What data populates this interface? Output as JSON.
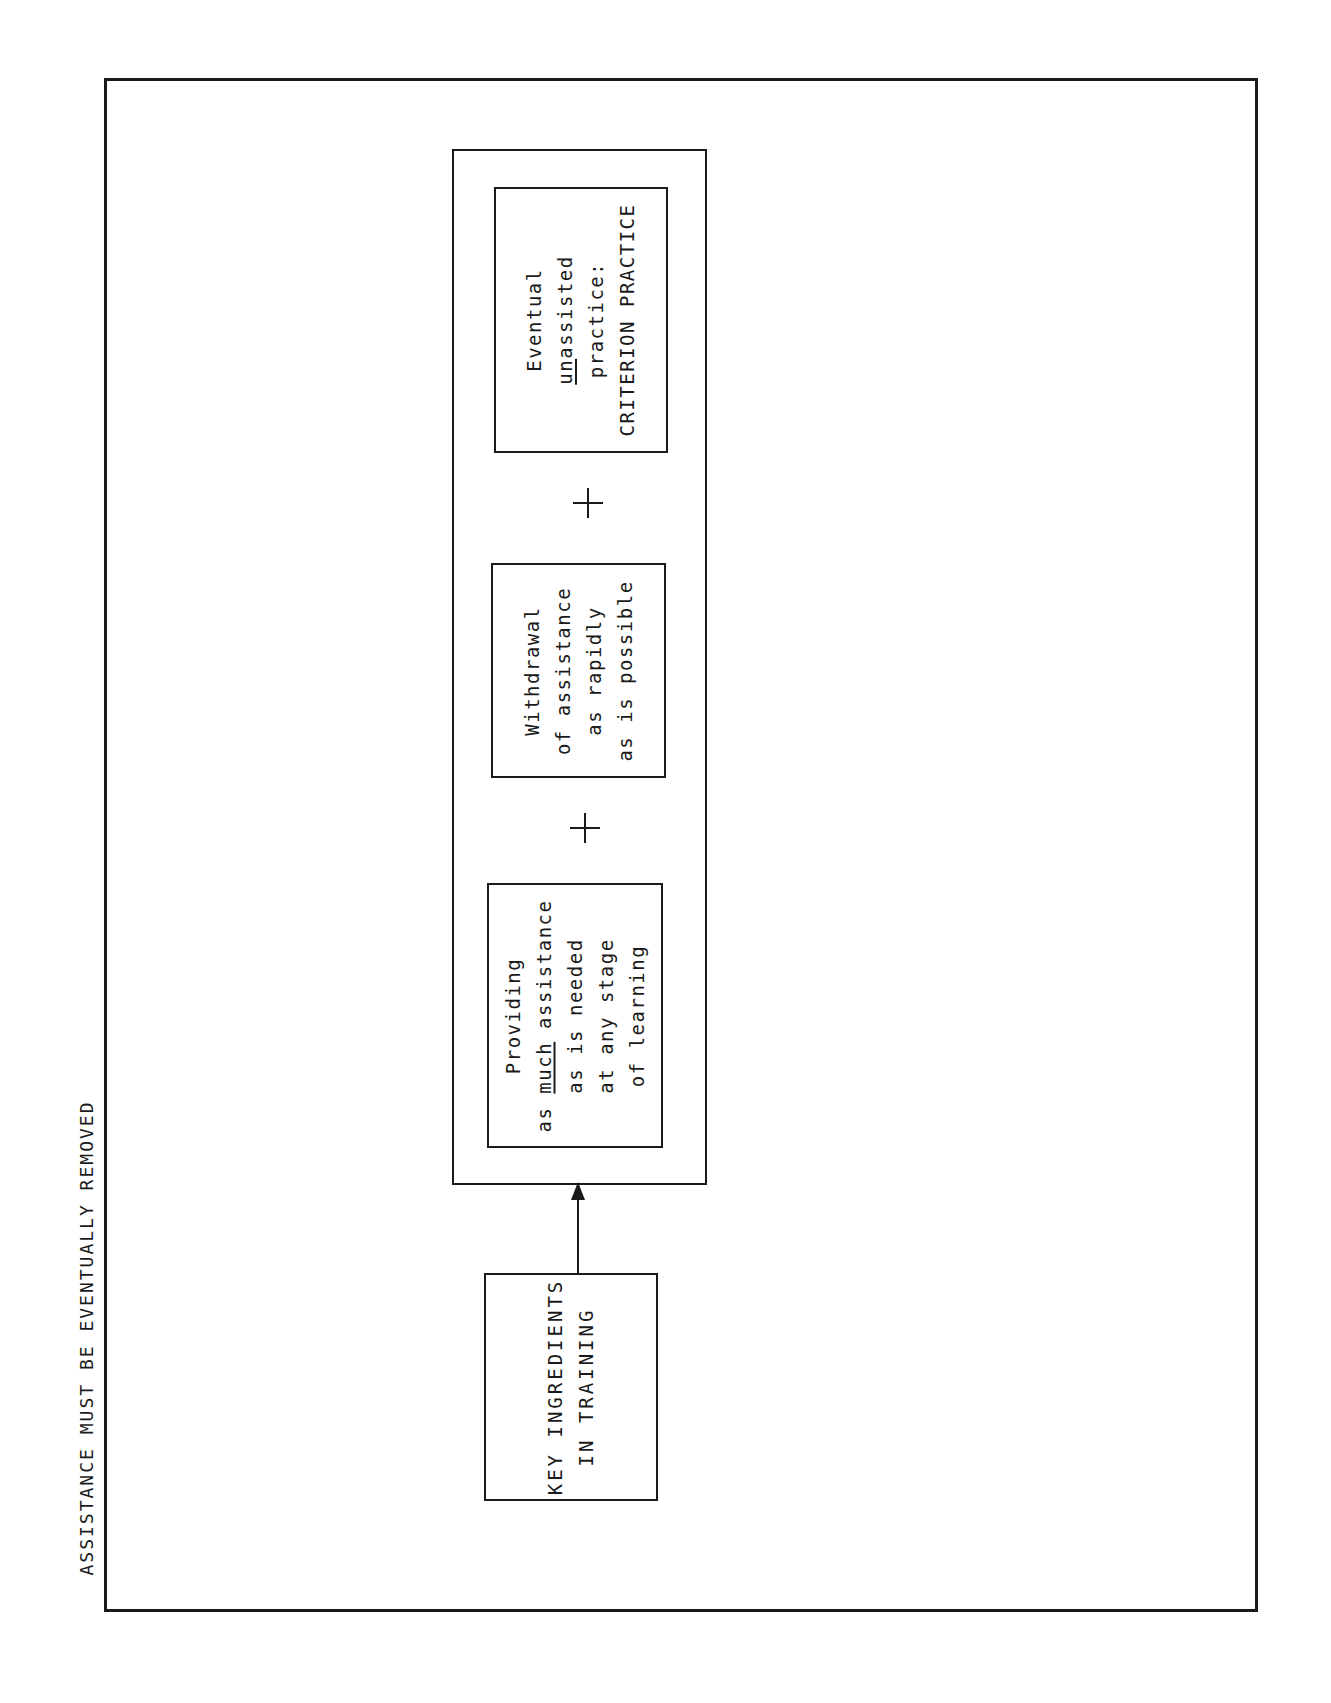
{
  "diagram": {
    "side_label": "ASSISTANCE MUST BE EVENTUALLY REMOVED",
    "source_box": {
      "lines": [
        "KEY INGREDIENTS",
        "IN TRAINING"
      ]
    },
    "ingredients": [
      {
        "lines": [
          "Providing",
          "as much assistance",
          "as is needed",
          "at any stage",
          "of learning"
        ],
        "underlined_word": "much"
      },
      {
        "lines": [
          "Withdrawal",
          "of assistance",
          "as rapidly",
          "as is possible"
        ]
      },
      {
        "lines": [
          "Eventual",
          "unassisted",
          "practice:",
          "CRITERION PRACTICE"
        ],
        "underlined_word": "un"
      }
    ],
    "connectors": {
      "plus_symbol": "+",
      "arrow": "arrow-up from KEY INGREDIENTS IN TRAINING to ingredients group"
    },
    "colors": {
      "ink": "#1a1a1a",
      "background": "#ffffff"
    }
  }
}
